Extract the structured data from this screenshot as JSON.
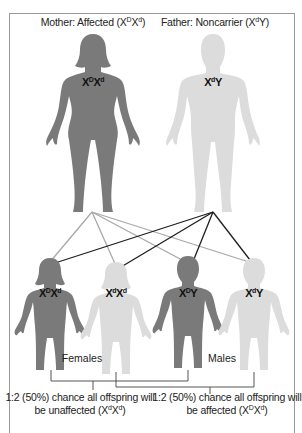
{
  "colors": {
    "affected": "#7a7a7a",
    "unaffected": "#dcdcdc",
    "mother_line": "#a8a8a8",
    "father_line": "#1e1e1e",
    "frame": "#9a9a9a"
  },
  "parents": {
    "mother": {
      "label_prefix": "Mother: Affected (X",
      "label_sup1": "D",
      "label_mid": "X",
      "label_sup2": "d",
      "label_suffix": ")",
      "genotype": {
        "base1": "X",
        "sup1": "D",
        "base2": "X",
        "sup2": "d"
      },
      "status": "affected"
    },
    "father": {
      "label_prefix": "Father: Noncarrier (X",
      "label_sup1": "d",
      "label_suffix": "Y)",
      "genotype": {
        "base1": "X",
        "sup1": "d",
        "base2": "Y"
      },
      "status": "unaffected"
    }
  },
  "offspring": [
    {
      "sex": "female",
      "status": "affected",
      "genotype": {
        "base1": "X",
        "sup1": "D",
        "base2": "X",
        "sup2": "d"
      }
    },
    {
      "sex": "female",
      "status": "unaffected",
      "genotype": {
        "base1": "X",
        "sup1": "d",
        "base2": "X",
        "sup2": "d"
      }
    },
    {
      "sex": "male",
      "status": "affected",
      "genotype": {
        "base1": "X",
        "sup1": "D",
        "base2": "Y"
      }
    },
    {
      "sex": "male",
      "status": "unaffected",
      "genotype": {
        "base1": "X",
        "sup1": "d",
        "base2": "Y"
      }
    }
  ],
  "group_labels": {
    "females": "Females",
    "males": "Males"
  },
  "captions": {
    "unaffected": {
      "line1": "1:2 (50%) chance all offspring will",
      "line2_prefix": "be unaffected (X",
      "line2_sup1": "d",
      "line2_mid": "X",
      "line2_sup2": "d",
      "line2_suffix": ")"
    },
    "affected": {
      "line1": "1:2 (50%) chance all offspring will",
      "line2_prefix": "be affected (X",
      "line2_sup1": "D",
      "line2_mid": "X",
      "line2_sup2": "d",
      "line2_suffix": ")"
    }
  }
}
